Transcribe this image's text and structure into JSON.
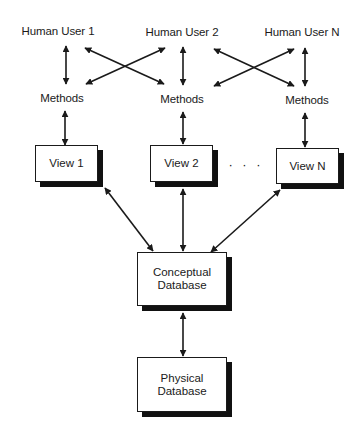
{
  "diagram": {
    "type": "database-architecture",
    "users": [
      {
        "label": "Human User 1"
      },
      {
        "label": "Human User 2"
      },
      {
        "label": "Human User N"
      }
    ],
    "methods": [
      {
        "label": "Methods"
      },
      {
        "label": "Methods"
      },
      {
        "label": "Methods"
      }
    ],
    "views": [
      {
        "label": "View 1"
      },
      {
        "label": "View 2"
      },
      {
        "label": "View N"
      }
    ],
    "ellipsis": "· · ·",
    "conceptual_db": {
      "line1": "Conceptual",
      "line2": "Database"
    },
    "physical_db": {
      "line1": "Physical",
      "line2": "Database"
    },
    "edges": [
      {
        "from": "Human User 1",
        "to": "Methods 1",
        "style": "bidirectional"
      },
      {
        "from": "Human User 1",
        "to": "Methods 2",
        "style": "bidirectional"
      },
      {
        "from": "Human User 2",
        "to": "Methods 1",
        "style": "bidirectional"
      },
      {
        "from": "Human User 2",
        "to": "Methods 2",
        "style": "bidirectional"
      },
      {
        "from": "Human User 2",
        "to": "Methods N",
        "style": "bidirectional"
      },
      {
        "from": "Human User N",
        "to": "Methods 2",
        "style": "bidirectional"
      },
      {
        "from": "Human User N",
        "to": "Methods N",
        "style": "bidirectional"
      },
      {
        "from": "Methods 1",
        "to": "View 1",
        "style": "bidirectional"
      },
      {
        "from": "Methods 2",
        "to": "View 2",
        "style": "bidirectional"
      },
      {
        "from": "Methods N",
        "to": "View N",
        "style": "bidirectional"
      },
      {
        "from": "View 1",
        "to": "Conceptual Database",
        "style": "bidirectional"
      },
      {
        "from": "View 2",
        "to": "Conceptual Database",
        "style": "bidirectional"
      },
      {
        "from": "View N",
        "to": "Conceptual Database",
        "style": "bidirectional"
      },
      {
        "from": "Conceptual Database",
        "to": "Physical Database",
        "style": "bidirectional"
      }
    ],
    "colors": {
      "stroke": "#1a1a1a",
      "shadow": "#111111",
      "background": "#ffffff"
    }
  }
}
